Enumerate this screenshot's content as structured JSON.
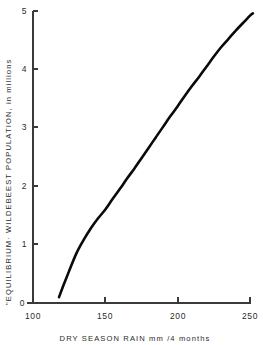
{
  "chart_data": {
    "type": "line",
    "title": "",
    "subtitle": "",
    "xlabel": "DRY SEASON RAIN   mm /4 months",
    "ylabel": "\"EQUILIBRIUM· WILDEBEEST POPULATION, in millions",
    "xlim": [
      100,
      250
    ],
    "ylim": [
      0,
      5
    ],
    "xticks": [
      100,
      150,
      200,
      250
    ],
    "xtick_labels": [
      "100",
      "150",
      "200",
      "250"
    ],
    "yticks": [
      0,
      1,
      2,
      3,
      4,
      5
    ],
    "ytick_labels": [
      "0",
      "1",
      "2",
      "3",
      "4",
      "5"
    ],
    "grid": false,
    "legend": "none",
    "series": [
      {
        "name": "equilibrium wildebeest population",
        "color": "#0a0a0a",
        "x": [
          118,
          121,
          125,
          130,
          135,
          140,
          145,
          150,
          155,
          160,
          165,
          170,
          175,
          180,
          185,
          190,
          195,
          200,
          205,
          210,
          215,
          220,
          225,
          230,
          235,
          240,
          245,
          250,
          252
        ],
        "values": [
          0.1,
          0.3,
          0.55,
          0.85,
          1.08,
          1.28,
          1.45,
          1.6,
          1.78,
          1.95,
          2.13,
          2.3,
          2.48,
          2.66,
          2.84,
          3.02,
          3.2,
          3.37,
          3.55,
          3.72,
          3.88,
          4.05,
          4.22,
          4.38,
          4.52,
          4.66,
          4.79,
          4.92,
          4.96
        ]
      }
    ],
    "annotations": []
  },
  "axes": {
    "x_axis_name": "DRY SEASON RAIN",
    "x_axis_units": "mm /4 months",
    "y_axis_name": "\"EQUILIBRIUM· WILDEBEEST POPULATION, in millions"
  },
  "colors": {
    "curve": "#0a0a0a",
    "axis": "#3a3a3a",
    "background": "#ffffff",
    "text": "#2b2b2b"
  }
}
